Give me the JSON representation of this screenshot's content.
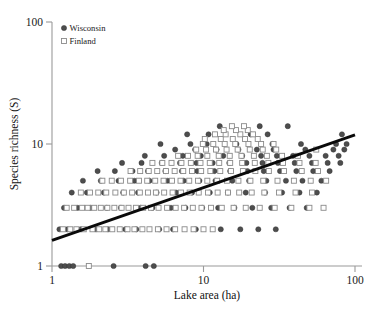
{
  "chart_data": {
    "type": "scatter",
    "title": "",
    "xlabel": "Lake area (ha)",
    "ylabel": "Species richness (S)",
    "xscale": "log",
    "yscale": "log",
    "xlim": [
      1,
      100
    ],
    "ylim": [
      1,
      100
    ],
    "xticks": [
      1,
      10,
      100
    ],
    "xticklabels": [
      "1",
      "10",
      "100"
    ],
    "yticks": [
      1,
      10,
      100
    ],
    "yticklabels": [
      "1",
      "10",
      "100"
    ],
    "grid": false,
    "legend_position": "top-left",
    "legend": [
      {
        "name": "Wisconsin",
        "marker": "filled-circle",
        "color": "#4d4d4d"
      },
      {
        "name": "Finland",
        "marker": "open-square",
        "color": "#8a8a8a"
      }
    ],
    "trendline": {
      "label": "species-area regression",
      "x": [
        1.0,
        100.0
      ],
      "y": [
        1.62,
        11.9
      ]
    },
    "series": [
      {
        "name": "Wisconsin",
        "marker": "filled-circle",
        "points": [
          [
            1.15,
            1.0
          ],
          [
            1.22,
            1.0
          ],
          [
            1.3,
            1.0
          ],
          [
            1.38,
            1.0
          ],
          [
            2.55,
            1.0
          ],
          [
            4.15,
            1.0
          ],
          [
            4.7,
            1.0
          ],
          [
            1.12,
            2.0
          ],
          [
            1.26,
            2.0
          ],
          [
            1.55,
            2.0
          ],
          [
            1.95,
            2.0
          ],
          [
            2.35,
            2.0
          ],
          [
            3.05,
            2.0
          ],
          [
            3.6,
            2.0
          ],
          [
            5.1,
            2.0
          ],
          [
            6.3,
            2.0
          ],
          [
            8.9,
            2.0
          ],
          [
            13.0,
            2.0
          ],
          [
            17.5,
            2.0
          ],
          [
            23.0,
            2.0
          ],
          [
            30.0,
            2.0
          ],
          [
            1.2,
            3.0
          ],
          [
            1.48,
            3.0
          ],
          [
            1.8,
            3.0
          ],
          [
            2.3,
            3.0
          ],
          [
            2.85,
            3.0
          ],
          [
            3.85,
            3.0
          ],
          [
            4.6,
            3.0
          ],
          [
            6.1,
            3.0
          ],
          [
            7.6,
            3.0
          ],
          [
            9.8,
            3.0
          ],
          [
            12.5,
            3.0
          ],
          [
            16.0,
            3.0
          ],
          [
            21.0,
            3.0
          ],
          [
            28.0,
            3.0
          ],
          [
            37.0,
            3.0
          ],
          [
            48.0,
            3.0
          ],
          [
            1.35,
            4.0
          ],
          [
            1.7,
            4.0
          ],
          [
            2.2,
            4.0
          ],
          [
            2.95,
            4.0
          ],
          [
            3.7,
            4.0
          ],
          [
            4.9,
            4.0
          ],
          [
            6.6,
            4.0
          ],
          [
            8.4,
            4.0
          ],
          [
            11.0,
            4.0
          ],
          [
            14.5,
            4.0
          ],
          [
            19.0,
            4.0
          ],
          [
            25.5,
            4.0
          ],
          [
            33.0,
            4.0
          ],
          [
            43.0,
            4.0
          ],
          [
            56.0,
            4.0
          ],
          [
            1.6,
            5.0
          ],
          [
            2.1,
            5.0
          ],
          [
            2.75,
            5.0
          ],
          [
            3.5,
            5.0
          ],
          [
            4.4,
            5.0
          ],
          [
            5.8,
            5.0
          ],
          [
            7.4,
            5.0
          ],
          [
            9.4,
            5.0
          ],
          [
            12.0,
            5.0
          ],
          [
            15.5,
            5.0
          ],
          [
            20.0,
            5.0
          ],
          [
            26.0,
            5.0
          ],
          [
            35.0,
            5.0
          ],
          [
            45.0,
            5.0
          ],
          [
            60.0,
            5.0
          ],
          [
            2.0,
            6.0
          ],
          [
            2.6,
            6.0
          ],
          [
            3.4,
            6.0
          ],
          [
            4.3,
            6.0
          ],
          [
            5.6,
            6.0
          ],
          [
            7.2,
            6.0
          ],
          [
            9.1,
            6.0
          ],
          [
            11.8,
            6.0
          ],
          [
            15.0,
            6.0
          ],
          [
            19.5,
            6.0
          ],
          [
            25.0,
            6.0
          ],
          [
            32.0,
            6.0
          ],
          [
            41.0,
            6.0
          ],
          [
            53.0,
            6.0
          ],
          [
            68.0,
            6.0
          ],
          [
            2.9,
            7.0
          ],
          [
            3.9,
            7.0
          ],
          [
            5.3,
            7.0
          ],
          [
            7.0,
            7.0
          ],
          [
            9.0,
            7.0
          ],
          [
            11.5,
            7.0
          ],
          [
            14.8,
            7.0
          ],
          [
            19.2,
            7.0
          ],
          [
            24.5,
            7.0
          ],
          [
            31.0,
            7.0
          ],
          [
            40.0,
            7.0
          ],
          [
            52.0,
            7.0
          ],
          [
            66.0,
            7.0
          ],
          [
            80.0,
            7.0
          ],
          [
            4.1,
            8.0
          ],
          [
            5.5,
            8.0
          ],
          [
            7.3,
            8.0
          ],
          [
            9.6,
            8.0
          ],
          [
            13.5,
            8.0
          ],
          [
            18.0,
            8.0
          ],
          [
            24.0,
            8.0
          ],
          [
            30.5,
            8.0
          ],
          [
            39.0,
            8.0
          ],
          [
            50.0,
            8.0
          ],
          [
            64.0,
            8.0
          ],
          [
            78.0,
            8.0
          ],
          [
            6.5,
            9.0
          ],
          [
            8.8,
            9.0
          ],
          [
            12.2,
            9.0
          ],
          [
            17.0,
            9.0
          ],
          [
            22.5,
            9.0
          ],
          [
            29.0,
            9.0
          ],
          [
            47.0,
            9.0
          ],
          [
            72.0,
            9.0
          ],
          [
            85.0,
            9.0
          ],
          [
            5.2,
            10.0
          ],
          [
            8.2,
            10.0
          ],
          [
            10.5,
            10.0
          ],
          [
            16.5,
            10.0
          ],
          [
            28.5,
            10.0
          ],
          [
            44.0,
            10.0
          ],
          [
            75.0,
            10.0
          ],
          [
            88.0,
            10.0
          ],
          [
            7.8,
            12.0
          ],
          [
            10.8,
            12.0
          ],
          [
            20.5,
            12.0
          ],
          [
            26.5,
            12.0
          ],
          [
            82.0,
            12.0
          ],
          [
            12.8,
            14.0
          ],
          [
            23.5,
            14.0
          ],
          [
            36.0,
            14.0
          ]
        ]
      },
      {
        "name": "Finland",
        "marker": "open-square",
        "points": [
          [
            1.75,
            1.0
          ],
          [
            1.18,
            2.0
          ],
          [
            1.32,
            2.0
          ],
          [
            1.45,
            2.0
          ],
          [
            1.62,
            2.0
          ],
          [
            1.85,
            2.0
          ],
          [
            2.05,
            2.0
          ],
          [
            2.25,
            2.0
          ],
          [
            2.5,
            2.0
          ],
          [
            2.8,
            2.0
          ],
          [
            3.15,
            2.0
          ],
          [
            3.5,
            2.0
          ],
          [
            3.95,
            2.0
          ],
          [
            4.4,
            2.0
          ],
          [
            5.0,
            2.0
          ],
          [
            5.7,
            2.0
          ],
          [
            6.5,
            2.0
          ],
          [
            7.5,
            2.0
          ],
          [
            8.6,
            2.0
          ],
          [
            10.0,
            2.0
          ],
          [
            11.5,
            2.0
          ],
          [
            1.25,
            3.0
          ],
          [
            1.4,
            3.0
          ],
          [
            1.58,
            3.0
          ],
          [
            1.72,
            3.0
          ],
          [
            1.9,
            3.0
          ],
          [
            2.1,
            3.0
          ],
          [
            2.32,
            3.0
          ],
          [
            2.58,
            3.0
          ],
          [
            2.88,
            3.0
          ],
          [
            3.2,
            3.0
          ],
          [
            3.58,
            3.0
          ],
          [
            4.0,
            3.0
          ],
          [
            4.5,
            3.0
          ],
          [
            5.05,
            3.0
          ],
          [
            5.75,
            3.0
          ],
          [
            6.55,
            3.0
          ],
          [
            7.45,
            3.0
          ],
          [
            8.5,
            3.0
          ],
          [
            9.7,
            3.0
          ],
          [
            11.2,
            3.0
          ],
          [
            13.2,
            3.0
          ],
          [
            15.8,
            3.0
          ],
          [
            19.0,
            3.0
          ],
          [
            23.5,
            3.0
          ],
          [
            29.5,
            3.0
          ],
          [
            38.0,
            3.0
          ],
          [
            50.0,
            3.0
          ],
          [
            62.0,
            3.0
          ],
          [
            1.55,
            4.0
          ],
          [
            1.78,
            4.0
          ],
          [
            2.02,
            4.0
          ],
          [
            2.28,
            4.0
          ],
          [
            2.62,
            4.0
          ],
          [
            2.98,
            4.0
          ],
          [
            3.38,
            4.0
          ],
          [
            3.8,
            4.0
          ],
          [
            4.3,
            4.0
          ],
          [
            4.85,
            4.0
          ],
          [
            5.5,
            4.0
          ],
          [
            6.25,
            4.0
          ],
          [
            7.1,
            4.0
          ],
          [
            8.1,
            4.0
          ],
          [
            9.3,
            4.0
          ],
          [
            10.7,
            4.0
          ],
          [
            12.4,
            4.0
          ],
          [
            14.5,
            4.0
          ],
          [
            17.2,
            4.0
          ],
          [
            20.8,
            4.0
          ],
          [
            25.2,
            4.0
          ],
          [
            31.5,
            4.0
          ],
          [
            40.5,
            4.0
          ],
          [
            52.0,
            4.0
          ],
          [
            2.15,
            5.0
          ],
          [
            2.48,
            5.0
          ],
          [
            2.85,
            5.0
          ],
          [
            3.28,
            5.0
          ],
          [
            3.75,
            5.0
          ],
          [
            4.25,
            5.0
          ],
          [
            4.8,
            5.0
          ],
          [
            5.45,
            5.0
          ],
          [
            6.2,
            5.0
          ],
          [
            7.05,
            5.0
          ],
          [
            8.05,
            5.0
          ],
          [
            9.2,
            5.0
          ],
          [
            10.6,
            5.0
          ],
          [
            12.3,
            5.0
          ],
          [
            14.3,
            5.0
          ],
          [
            17.0,
            5.0
          ],
          [
            20.4,
            5.0
          ],
          [
            24.8,
            5.0
          ],
          [
            30.8,
            5.0
          ],
          [
            39.5,
            5.0
          ],
          [
            51.0,
            5.0
          ],
          [
            64.5,
            5.0
          ],
          [
            3.3,
            6.0
          ],
          [
            3.82,
            6.0
          ],
          [
            4.35,
            6.0
          ],
          [
            4.95,
            6.0
          ],
          [
            5.65,
            6.0
          ],
          [
            6.45,
            6.0
          ],
          [
            7.35,
            6.0
          ],
          [
            8.4,
            6.0
          ],
          [
            9.65,
            6.0
          ],
          [
            11.1,
            6.0
          ],
          [
            12.9,
            6.0
          ],
          [
            15.2,
            6.0
          ],
          [
            18.2,
            6.0
          ],
          [
            22.0,
            6.0
          ],
          [
            27.0,
            6.0
          ],
          [
            34.0,
            6.0
          ],
          [
            44.5,
            6.0
          ],
          [
            57.0,
            6.0
          ],
          [
            4.6,
            7.0
          ],
          [
            5.35,
            7.0
          ],
          [
            6.15,
            7.0
          ],
          [
            7.15,
            7.0
          ],
          [
            8.25,
            7.0
          ],
          [
            9.55,
            7.0
          ],
          [
            11.0,
            7.0
          ],
          [
            12.7,
            7.0
          ],
          [
            15.0,
            7.0
          ],
          [
            18.0,
            7.0
          ],
          [
            21.8,
            7.0
          ],
          [
            26.8,
            7.0
          ],
          [
            33.5,
            7.0
          ],
          [
            43.0,
            7.0
          ],
          [
            55.0,
            7.0
          ],
          [
            6.8,
            8.0
          ],
          [
            7.9,
            8.0
          ],
          [
            9.15,
            8.0
          ],
          [
            10.6,
            8.0
          ],
          [
            12.6,
            8.0
          ],
          [
            14.9,
            8.0
          ],
          [
            17.8,
            8.0
          ],
          [
            21.5,
            8.0
          ],
          [
            26.2,
            8.0
          ],
          [
            33.0,
            8.0
          ],
          [
            42.0,
            8.0
          ],
          [
            8.95,
            9.0
          ],
          [
            10.4,
            9.0
          ],
          [
            12.1,
            9.0
          ],
          [
            14.2,
            9.0
          ],
          [
            16.8,
            9.0
          ],
          [
            20.2,
            9.0
          ],
          [
            24.6,
            9.0
          ],
          [
            30.2,
            9.0
          ],
          [
            55.5,
            9.0
          ],
          [
            9.9,
            10.0
          ],
          [
            11.6,
            10.0
          ],
          [
            13.8,
            10.0
          ],
          [
            16.2,
            10.0
          ],
          [
            19.8,
            10.0
          ],
          [
            24.0,
            10.0
          ],
          [
            29.0,
            10.0
          ],
          [
            10.2,
            11.0
          ],
          [
            13.0,
            11.0
          ],
          [
            15.6,
            11.0
          ],
          [
            18.8,
            11.0
          ],
          [
            22.8,
            11.0
          ],
          [
            11.9,
            12.0
          ],
          [
            14.0,
            12.0
          ],
          [
            17.5,
            12.0
          ],
          [
            21.2,
            12.0
          ],
          [
            13.6,
            13.0
          ],
          [
            16.4,
            13.0
          ],
          [
            19.6,
            13.0
          ],
          [
            15.4,
            14.0
          ],
          [
            18.5,
            14.0
          ]
        ]
      }
    ]
  }
}
